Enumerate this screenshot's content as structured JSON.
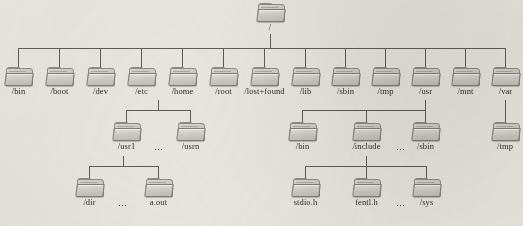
{
  "diagram": {
    "icon_name": "folder-icon",
    "ellipsis_glyph": "⋯",
    "background_color": "#e8e5de",
    "line_color": "#5e5c58",
    "text_color": "#2b2a28"
  },
  "root": {
    "label": "/"
  },
  "level1": [
    {
      "label": "/bin"
    },
    {
      "label": "/boot"
    },
    {
      "label": "/dev"
    },
    {
      "label": "/etc"
    },
    {
      "label": "/home"
    },
    {
      "label": "/root"
    },
    {
      "label": "/lost+found"
    },
    {
      "label": "/lib"
    },
    {
      "label": "/sbin"
    },
    {
      "label": "/tmp"
    },
    {
      "label": "/usr"
    },
    {
      "label": "/mnt"
    },
    {
      "label": "/var"
    }
  ],
  "home_children": [
    {
      "label": "/usr1"
    },
    {
      "label": "/usrn"
    }
  ],
  "usr1_children": [
    {
      "label": "/dir"
    },
    {
      "label": "a.out"
    }
  ],
  "usr_children": [
    {
      "label": "/bin"
    },
    {
      "label": "/include"
    },
    {
      "label": "/sbin"
    }
  ],
  "include_children": [
    {
      "label": "stdio.h"
    },
    {
      "label": "fentl.h"
    },
    {
      "label": "/sys"
    }
  ],
  "var_children": [
    {
      "label": "/tmp"
    }
  ]
}
